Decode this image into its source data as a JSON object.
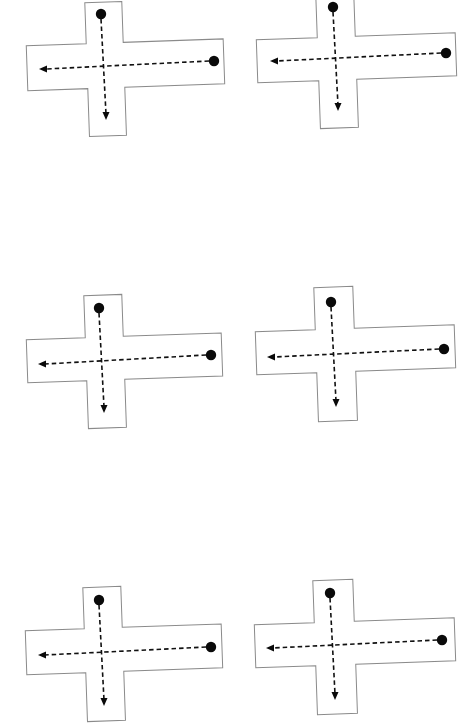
{
  "diagram": {
    "colors": {
      "background": "#ffffff",
      "outline": "#8a8a8a",
      "path": "#111111",
      "dot": "#0a0a0a"
    },
    "crosses": [
      {
        "id": "cross-1",
        "rotation_deg": -2,
        "vertical_arm": {
          "x1": 87,
          "x2": 124,
          "y1": 2,
          "y2": 136
        },
        "horizontal_arm": {
          "x1": 27,
          "x2": 224,
          "y1": 43,
          "y2": 88
        },
        "top_dot": [
          101,
          14
        ],
        "right_dot": [
          214,
          61
        ],
        "down_arrow_tip": [
          106,
          120
        ],
        "left_arrow_tip": [
          39,
          69
        ]
      },
      {
        "id": "cross-2",
        "rotation_deg": -2,
        "vertical_arm": {
          "x1": 318,
          "x2": 356,
          "y1": -2,
          "y2": 128
        },
        "horizontal_arm": {
          "x1": 257,
          "x2": 456,
          "y1": 37,
          "y2": 80
        },
        "top_dot": [
          333,
          7
        ],
        "right_dot": [
          446,
          53
        ],
        "down_arrow_tip": [
          338,
          111
        ],
        "left_arrow_tip": [
          270,
          61
        ]
      },
      {
        "id": "cross-3",
        "rotation_deg": -2,
        "vertical_arm": {
          "x1": 86,
          "x2": 124,
          "y1": 295,
          "y2": 428
        },
        "horizontal_arm": {
          "x1": 27,
          "x2": 222,
          "y1": 337,
          "y2": 380
        },
        "top_dot": [
          99,
          308
        ],
        "right_dot": [
          211,
          355
        ],
        "down_arrow_tip": [
          104,
          413
        ],
        "left_arrow_tip": [
          38,
          364
        ]
      },
      {
        "id": "cross-4",
        "rotation_deg": -2,
        "vertical_arm": {
          "x1": 316,
          "x2": 355,
          "y1": 287,
          "y2": 421
        },
        "horizontal_arm": {
          "x1": 256,
          "x2": 455,
          "y1": 329,
          "y2": 372
        },
        "top_dot": [
          331,
          302
        ],
        "right_dot": [
          444,
          349
        ],
        "down_arrow_tip": [
          336,
          407
        ],
        "left_arrow_tip": [
          267,
          357
        ]
      },
      {
        "id": "cross-5",
        "rotation_deg": -2,
        "vertical_arm": {
          "x1": 85,
          "x2": 123,
          "y1": 587,
          "y2": 721
        },
        "horizontal_arm": {
          "x1": 26,
          "x2": 222,
          "y1": 628,
          "y2": 672
        },
        "top_dot": [
          99,
          600
        ],
        "right_dot": [
          211,
          647
        ],
        "down_arrow_tip": [
          104,
          706
        ],
        "left_arrow_tip": [
          38,
          655
        ]
      },
      {
        "id": "cross-6",
        "rotation_deg": -2,
        "vertical_arm": {
          "x1": 315,
          "x2": 355,
          "y1": 580,
          "y2": 714
        },
        "horizontal_arm": {
          "x1": 255,
          "x2": 455,
          "y1": 622,
          "y2": 665
        },
        "top_dot": [
          330,
          593
        ],
        "right_dot": [
          442,
          640
        ],
        "down_arrow_tip": [
          335,
          700
        ],
        "left_arrow_tip": [
          266,
          648
        ]
      }
    ]
  }
}
